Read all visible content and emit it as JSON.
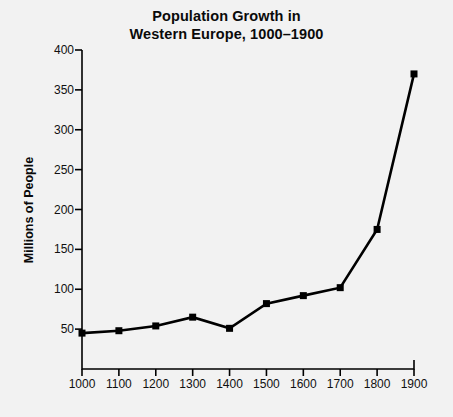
{
  "chart_data": {
    "type": "line",
    "title": "Population Growth in Western Europe, 1000–1900",
    "title_lines": [
      "Population Growth in",
      "Western Europe, 1000–1900"
    ],
    "xlabel": "",
    "ylabel": "Millions of People",
    "x": [
      1000,
      1100,
      1200,
      1300,
      1400,
      1500,
      1600,
      1700,
      1800,
      1900
    ],
    "values": [
      45,
      48,
      54,
      65,
      51,
      82,
      92,
      102,
      175,
      370
    ],
    "categories": [
      "1000",
      "1100",
      "1200",
      "1300",
      "1400",
      "1500",
      "1600",
      "1700",
      "1800",
      "1900"
    ],
    "xtick_labels": [
      "1000",
      "1100",
      "1200",
      "1300",
      "1400",
      "1500",
      "1600",
      "1700",
      "1800",
      "1900"
    ],
    "ytick_labels": [
      "50",
      "100",
      "150",
      "200",
      "250",
      "300",
      "350",
      "400"
    ],
    "ytick_values": [
      50,
      100,
      150,
      200,
      250,
      300,
      350,
      400
    ],
    "xlim": [
      1000,
      1900
    ],
    "ylim": [
      0,
      400
    ],
    "grid": false,
    "legend": false,
    "marker": "square",
    "line_color": "#000000",
    "marker_color": "#000000",
    "background_color": "#f2f2f2",
    "axis_color": "#000000",
    "series": [
      {
        "name": "Population of Western Europe",
        "values": [
          45,
          48,
          54,
          65,
          51,
          82,
          92,
          102,
          175,
          370
        ]
      }
    ]
  }
}
